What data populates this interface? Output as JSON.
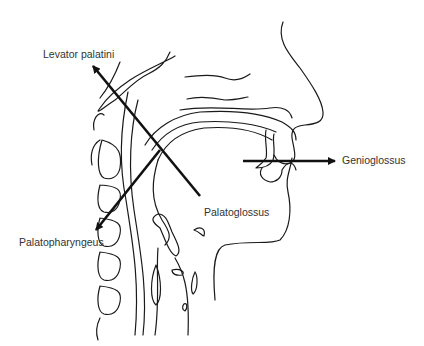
{
  "figure": {
    "labels": {
      "levator_palatini": "Levator palatini",
      "genioglossus": "Genioglossus",
      "palatoglossus": "Palatoglossus",
      "palatopharyngeus": "Palatopharyngeus"
    },
    "colors": {
      "line": "#1a1a1a",
      "arrow": "#111111",
      "text": "#333333",
      "background": "#ffffff"
    }
  }
}
